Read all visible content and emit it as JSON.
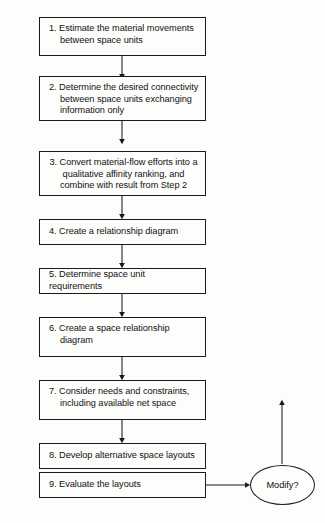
{
  "diagram": {
    "orientation": "top-to-bottom",
    "background_color": "#fdfdfc",
    "line_color": "#1a1a1a",
    "text_color": "#111111",
    "nodes": [
      {
        "id": "step1",
        "shape": "rectangle",
        "text": "1. Estimate the material movements between space units"
      },
      {
        "id": "step2",
        "shape": "rectangle",
        "text": "2. Determine the desired connectivity between space units exchanging information only"
      },
      {
        "id": "step3",
        "shape": "rectangle",
        "text": "3. Convert material-flow efforts into a qualitative affinity ranking, and combine with result from Step 2"
      },
      {
        "id": "step4",
        "shape": "rectangle",
        "text": "4. Create a relationship diagram"
      },
      {
        "id": "step5",
        "shape": "rectangle",
        "text": "5. Determine space unit requirements"
      },
      {
        "id": "step6",
        "shape": "rectangle",
        "text": "6. Create a space relationship diagram"
      },
      {
        "id": "step7",
        "shape": "rectangle",
        "text": "7. Consider needs and constraints, including available net space"
      },
      {
        "id": "step8",
        "shape": "rectangle",
        "text": "8. Develop alternative space layouts"
      },
      {
        "id": "step9",
        "shape": "rectangle",
        "text": "9. Evaluate the layouts"
      },
      {
        "id": "decision",
        "shape": "ellipse",
        "text": "Modify?"
      }
    ],
    "edges": [
      {
        "from": "step1",
        "to": "step2",
        "direction": "down"
      },
      {
        "from": "step2",
        "to": "step3",
        "direction": "down"
      },
      {
        "from": "step3",
        "to": "step4",
        "direction": "down"
      },
      {
        "from": "step4",
        "to": "step5",
        "direction": "down"
      },
      {
        "from": "step5",
        "to": "step6",
        "direction": "down"
      },
      {
        "from": "step6",
        "to": "step7",
        "direction": "down"
      },
      {
        "from": "step7",
        "to": "step8",
        "direction": "down"
      },
      {
        "from": "step8",
        "to": "step9",
        "direction": "down"
      },
      {
        "from": "step9",
        "to": "decision",
        "direction": "right"
      },
      {
        "from": "decision",
        "to": "feedback-loop",
        "direction": "up"
      }
    ]
  }
}
